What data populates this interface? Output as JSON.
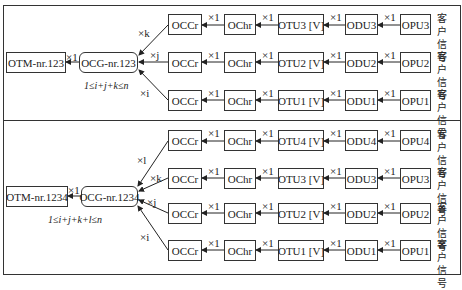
{
  "panels": [
    {
      "otm": "OTM-nr.123",
      "ocg": "OCG-nr.123",
      "otm_ocg_mult": "×1",
      "condition": "1≤i+j+k≤n",
      "branches": [
        {
          "mult": "×k",
          "occ": "OCCr",
          "och": "OChr",
          "otu": "OTU3 [V]",
          "odu": "ODU3",
          "opu": "OPU3",
          "client": "客户信号"
        },
        {
          "mult": "×j",
          "occ": "OCCr",
          "och": "OChr",
          "otu": "OTU2 [V]",
          "odu": "ODU2",
          "opu": "OPU2",
          "client": "客户信号"
        },
        {
          "mult": "×i",
          "occ": "OCCr",
          "och": "OChr",
          "otu": "OTU1 [V]",
          "odu": "ODU1",
          "opu": "OPU1",
          "client": "客户信号"
        }
      ]
    },
    {
      "otm": "OTM-nr.1234",
      "ocg": "OCG-nr.1234",
      "otm_ocg_mult": "×1",
      "condition": "1≤i+j+k+l≤n",
      "branches": [
        {
          "mult": "×l",
          "occ": "OCCr",
          "och": "OChr",
          "otu": "OTU4 [V]",
          "odu": "ODU4",
          "opu": "OPU4",
          "client": "客户信号"
        },
        {
          "mult": "×k",
          "occ": "OCCr",
          "och": "OChr",
          "otu": "OTU3 [V]",
          "odu": "ODU3",
          "opu": "OPU3",
          "client": "客户信号"
        },
        {
          "mult": "×j",
          "occ": "OCCr",
          "och": "OChr",
          "otu": "OTU2 [V]",
          "odu": "ODU2",
          "opu": "OPU2",
          "client": "客户信号"
        },
        {
          "mult": "×i",
          "occ": "OCCr",
          "och": "OChr",
          "otu": "OTU1 [V]",
          "odu": "ODU1",
          "opu": "OPU1",
          "client": "客户信号"
        }
      ]
    }
  ],
  "chain_mult": "×1"
}
